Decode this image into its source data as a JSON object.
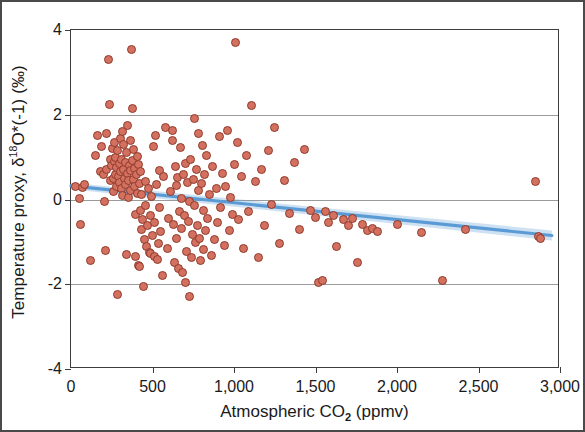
{
  "chart_data": {
    "type": "scatter",
    "title": "",
    "xlabel": "Atmospheric CO2 (ppmv)",
    "xlabel_parts": {
      "pre": "Atmospheric CO",
      "sub": "2",
      "post": " (ppmv)"
    },
    "ylabel": "Temperature proxy, δ18O*(-1) (‰)",
    "ylabel_parts": {
      "pre": "Temperature proxy, δ",
      "sup": "18",
      "post": "O*(-1) (‰)"
    },
    "xlim": [
      0,
      3000
    ],
    "ylim": [
      -4,
      4
    ],
    "xticks": [
      0,
      500,
      1000,
      1500,
      2000,
      2500,
      3000
    ],
    "xticklabels": [
      "0",
      "500",
      "1,000",
      "1,500",
      "2,000",
      "2,500",
      "3,000"
    ],
    "yticks": [
      4,
      2,
      0,
      -2,
      -4
    ],
    "yticklabels": [
      "4",
      "2",
      "0",
      "-2",
      "-4"
    ],
    "gridlines_y": [
      2,
      0,
      -2
    ],
    "grid": "horizontal",
    "legend": "none",
    "marker_fill": "#d4705f",
    "marker_edge": "#8e3b2c",
    "trendline_color": "#5b9bd5",
    "trendline": {
      "type": "linear-fit-with-confidence-band",
      "x_start": 0,
      "y_start": 0.32,
      "x_end": 2950,
      "y_end": -0.85,
      "slope_per_ppmv": -0.000397,
      "intercept": 0.32
    },
    "points": [
      [
        30,
        0.3
      ],
      [
        55,
        0.02
      ],
      [
        60,
        -0.6
      ],
      [
        70,
        0.28
      ],
      [
        85,
        0.35
      ],
      [
        120,
        -1.45
      ],
      [
        150,
        1.05
      ],
      [
        165,
        1.5
      ],
      [
        180,
        0.65
      ],
      [
        190,
        1.25
      ],
      [
        200,
        0.6
      ],
      [
        205,
        -0.05
      ],
      [
        210,
        -1.2
      ],
      [
        215,
        0.7
      ],
      [
        220,
        1.55
      ],
      [
        230,
        3.3
      ],
      [
        235,
        2.25
      ],
      [
        240,
        0.95
      ],
      [
        245,
        0.45
      ],
      [
        250,
        0.8
      ],
      [
        255,
        1.2
      ],
      [
        258,
        0.5
      ],
      [
        262,
        0.2
      ],
      [
        265,
        0.9
      ],
      [
        268,
        1.35
      ],
      [
        272,
        0.6
      ],
      [
        275,
        1.0
      ],
      [
        278,
        0.3
      ],
      [
        282,
        0.75
      ],
      [
        285,
        1.15
      ],
      [
        288,
        -2.25
      ],
      [
        292,
        0.55
      ],
      [
        295,
        0.85
      ],
      [
        298,
        0.4
      ],
      [
        302,
        1.45
      ],
      [
        305,
        0.65
      ],
      [
        308,
        0.25
      ],
      [
        312,
        0.95
      ],
      [
        315,
        1.6
      ],
      [
        318,
        0.1
      ],
      [
        322,
        0.7
      ],
      [
        325,
        1.3
      ],
      [
        328,
        0.5
      ],
      [
        332,
        0.88
      ],
      [
        335,
        0.35
      ],
      [
        338,
        -1.3
      ],
      [
        342,
        1.1
      ],
      [
        345,
        0.62
      ],
      [
        348,
        1.75
      ],
      [
        352,
        0.45
      ],
      [
        355,
        0.05
      ],
      [
        358,
        0.8
      ],
      [
        362,
        1.4
      ],
      [
        365,
        0.68
      ],
      [
        368,
        0.22
      ],
      [
        372,
        3.55
      ],
      [
        375,
        2.15
      ],
      [
        378,
        0.92
      ],
      [
        382,
        0.48
      ],
      [
        385,
        1.18
      ],
      [
        388,
        0.3
      ],
      [
        392,
        0.72
      ],
      [
        395,
        -0.35
      ],
      [
        398,
        -1.35
      ],
      [
        402,
        0.58
      ],
      [
        405,
        1.02
      ],
      [
        408,
        0.15
      ],
      [
        412,
        0.82
      ],
      [
        415,
        -1.55
      ],
      [
        418,
        -1.58
      ],
      [
        422,
        0.38
      ],
      [
        425,
        0.65
      ],
      [
        428,
        -0.25
      ],
      [
        432,
        -0.7
      ],
      [
        435,
        0.12
      ],
      [
        440,
        -0.48
      ],
      [
        445,
        -2.05
      ],
      [
        450,
        -0.95
      ],
      [
        455,
        -0.15
      ],
      [
        460,
        0.42
      ],
      [
        465,
        -1.1
      ],
      [
        470,
        -0.62
      ],
      [
        475,
        0.25
      ],
      [
        480,
        -1.25
      ],
      [
        485,
        -0.38
      ],
      [
        490,
        -1.28
      ],
      [
        495,
        0.08
      ],
      [
        500,
        -0.85
      ],
      [
        505,
        1.25
      ],
      [
        510,
        -1.35
      ],
      [
        515,
        -0.55
      ],
      [
        520,
        1.5
      ],
      [
        525,
        0.35
      ],
      [
        530,
        -1.42
      ],
      [
        535,
        -1.05
      ],
      [
        540,
        -0.2
      ],
      [
        545,
        0.68
      ],
      [
        550,
        -0.75
      ],
      [
        560,
        -1.8
      ],
      [
        570,
        0.55
      ],
      [
        580,
        1.7
      ],
      [
        590,
        -1.15
      ],
      [
        600,
        -0.45
      ],
      [
        610,
        0.18
      ],
      [
        620,
        1.62
      ],
      [
        625,
        1.4
      ],
      [
        630,
        -0.58
      ],
      [
        635,
        -1.48
      ],
      [
        640,
        0.78
      ],
      [
        645,
        0.32
      ],
      [
        650,
        -0.92
      ],
      [
        655,
        0.52
      ],
      [
        660,
        -1.62
      ],
      [
        665,
        -0.28
      ],
      [
        670,
        1.22
      ],
      [
        675,
        -0.68
      ],
      [
        680,
        0.02
      ],
      [
        685,
        -1.72
      ],
      [
        690,
        0.6
      ],
      [
        695,
        -0.38
      ],
      [
        700,
        0.85
      ],
      [
        705,
        -1.95
      ],
      [
        710,
        -1.22
      ],
      [
        715,
        0.4
      ],
      [
        720,
        -0.52
      ],
      [
        725,
        -2.3
      ],
      [
        730,
        -0.05
      ],
      [
        735,
        0.95
      ],
      [
        740,
        -1.38
      ],
      [
        745,
        -0.82
      ],
      [
        750,
        0.48
      ],
      [
        755,
        1.9
      ],
      [
        760,
        -0.15
      ],
      [
        765,
        -1.02
      ],
      [
        770,
        0.7
      ],
      [
        775,
        -0.62
      ],
      [
        780,
        1.55
      ],
      [
        785,
        0.22
      ],
      [
        790,
        -0.92
      ],
      [
        795,
        -1.45
      ],
      [
        800,
        0.38
      ],
      [
        805,
        1.28
      ],
      [
        810,
        -0.25
      ],
      [
        815,
        -1.18
      ],
      [
        820,
        0.58
      ],
      [
        825,
        -0.72
      ],
      [
        830,
        1.05
      ],
      [
        840,
        -0.45
      ],
      [
        850,
        0.12
      ],
      [
        860,
        -1.32
      ],
      [
        870,
        0.78
      ],
      [
        880,
        -0.95
      ],
      [
        890,
        0.25
      ],
      [
        900,
        -0.55
      ],
      [
        910,
        1.48
      ],
      [
        920,
        -0.18
      ],
      [
        930,
        0.62
      ],
      [
        940,
        -1.08
      ],
      [
        950,
        0.3
      ],
      [
        960,
        1.62
      ],
      [
        970,
        -0.72
      ],
      [
        980,
        0.05
      ],
      [
        990,
        -0.35
      ],
      [
        1000,
        0.82
      ],
      [
        1010,
        3.7
      ],
      [
        1020,
        1.35
      ],
      [
        1030,
        -0.48
      ],
      [
        1045,
        0.55
      ],
      [
        1060,
        -1.15
      ],
      [
        1075,
        1.05
      ],
      [
        1090,
        -0.28
      ],
      [
        1110,
        2.22
      ],
      [
        1130,
        0.42
      ],
      [
        1150,
        -1.38
      ],
      [
        1170,
        0.7
      ],
      [
        1190,
        -0.62
      ],
      [
        1210,
        1.15
      ],
      [
        1230,
        -0.12
      ],
      [
        1250,
        1.7
      ],
      [
        1280,
        -1.05
      ],
      [
        1310,
        0.45
      ],
      [
        1340,
        -0.32
      ],
      [
        1370,
        0.88
      ],
      [
        1400,
        -0.7
      ],
      [
        1430,
        1.18
      ],
      [
        1470,
        -0.25
      ],
      [
        1500,
        -0.42
      ],
      [
        1520,
        -1.95
      ],
      [
        1540,
        -1.92
      ],
      [
        1560,
        -0.28
      ],
      [
        1580,
        -0.55
      ],
      [
        1610,
        -0.38
      ],
      [
        1630,
        -1.12
      ],
      [
        1670,
        -0.48
      ],
      [
        1700,
        -0.62
      ],
      [
        1730,
        -0.45
      ],
      [
        1760,
        -1.48
      ],
      [
        1790,
        -0.58
      ],
      [
        1820,
        -0.72
      ],
      [
        1850,
        -0.68
      ],
      [
        1880,
        -0.75
      ],
      [
        2000,
        -0.6
      ],
      [
        2150,
        -0.78
      ],
      [
        2280,
        -1.92
      ],
      [
        2420,
        -0.7
      ],
      [
        2850,
        0.42
      ],
      [
        2870,
        -0.88
      ],
      [
        2880,
        -0.92
      ]
    ]
  },
  "axes": {
    "plot_left_px": 68,
    "plot_top_px": 27,
    "plot_width_px": 489,
    "plot_height_px": 339
  }
}
